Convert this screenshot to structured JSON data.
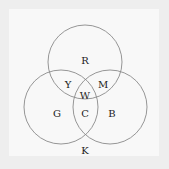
{
  "diagram": {
    "type": "venn-3",
    "circles": [
      {
        "id": "red",
        "cx": 85,
        "cy": 62,
        "r": 37
      },
      {
        "id": "green",
        "cx": 61,
        "cy": 107,
        "r": 37
      },
      {
        "id": "blue",
        "cx": 110,
        "cy": 107,
        "r": 37
      }
    ],
    "stroke_color": "#8a8a8a",
    "labels": {
      "R": {
        "text": "R",
        "x": 85,
        "y": 60
      },
      "Y": {
        "text": "Y",
        "x": 68,
        "y": 84
      },
      "M": {
        "text": "M",
        "x": 103,
        "y": 84
      },
      "W": {
        "text": "W",
        "x": 85,
        "y": 95
      },
      "G": {
        "text": "G",
        "x": 57,
        "y": 113
      },
      "C": {
        "text": "C",
        "x": 85,
        "y": 113
      },
      "B": {
        "text": "B",
        "x": 112,
        "y": 113
      },
      "K": {
        "text": "K",
        "x": 85,
        "y": 150
      }
    }
  }
}
